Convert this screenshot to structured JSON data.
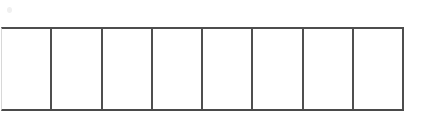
{
  "document": {
    "type": "scanned-form-fragment",
    "description": "Blank ruled grid row of eight empty rectangular boxes",
    "background_color": "#ffffff",
    "border_color": "#4e4e4e",
    "faint_edge_color": "#d8d8d8"
  },
  "grid": {
    "name": "empty-answer-boxes",
    "cell_count": 8,
    "cells": [
      {
        "index": "1",
        "value": ""
      },
      {
        "index": "2",
        "value": ""
      },
      {
        "index": "3",
        "value": ""
      },
      {
        "index": "4",
        "value": ""
      },
      {
        "index": "5",
        "value": ""
      },
      {
        "index": "6",
        "value": ""
      },
      {
        "index": "7",
        "value": ""
      },
      {
        "index": "8",
        "value": ""
      }
    ]
  },
  "artifacts": {
    "specks": [
      {
        "name": "scan-speck-top-left"
      },
      {
        "name": "scan-speck-mid"
      },
      {
        "name": "scan-speck-right"
      }
    ]
  }
}
